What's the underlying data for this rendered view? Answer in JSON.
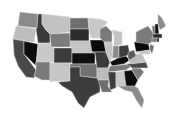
{
  "map": {
    "type": "choropleth",
    "region": "United States",
    "colormap": "grayscale",
    "states": [
      {
        "id": "WA",
        "fill": "#8a8a8a",
        "points": "20,12 38,14 37,28 18,26 19,18"
      },
      {
        "id": "OR",
        "fill": "#bdbdbd",
        "points": "16,26 36,29 34,42 13,39"
      },
      {
        "id": "CA",
        "fill": "#4a4a4a",
        "points": "13,39 24,41 24,54 36,70 34,78 26,77 18,66 14,55"
      },
      {
        "id": "NV",
        "fill": "#0d0d0d",
        "points": "24,41 38,44 36,66 24,54"
      },
      {
        "id": "ID",
        "fill": "#3a3a3a",
        "points": "38,14 42,14 42,24 46,30 50,34 50,43 38,43 36,29 37,28"
      },
      {
        "id": "MT",
        "fill": "#c2c2c2",
        "points": "42,14 70,17 70,32 50,34 46,30 42,24"
      },
      {
        "id": "WY",
        "fill": "#7c7c7c",
        "points": "50,34 70,33 71,47 51,47"
      },
      {
        "id": "UT",
        "fill": "#c9c9c9",
        "points": "38,44 50,43 51,47 54,48 54,62 36,62 36,66 38,44"
      },
      {
        "id": "AZ",
        "fill": "#7a7a7a",
        "points": "36,62 50,62 50,80 42,80 34,76 36,70"
      },
      {
        "id": "CO",
        "fill": "#3c3c3c",
        "points": "54,48 72,48 72,63 54,63"
      },
      {
        "id": "NM",
        "fill": "#c6c6c6",
        "points": "50,63 70,63 70,81 56,81 50,82 50,62"
      },
      {
        "id": "ND",
        "fill": "#6e6e6e",
        "points": "70,18 88,18 89,29 70,29"
      },
      {
        "id": "SD",
        "fill": "#2e2e2e",
        "points": "70,29 89,29 89,41 70,41"
      },
      {
        "id": "NE",
        "fill": "#c4c4c4",
        "points": "70,41 91,41 94,53 72,53 72,48 70,47"
      },
      {
        "id": "KS",
        "fill": "#0f0f0f",
        "points": "72,53 95,53 95,64 72,64"
      },
      {
        "id": "OK",
        "fill": "#707070",
        "points": "70,64 97,64 97,78 80,76 80,67 70,67"
      },
      {
        "id": "TX",
        "fill": "#3d3d3d",
        "points": "70,67 80,67 80,76 97,78 100,80 100,92 90,97 84,108 78,103 72,92 62,86 58,82 70,81"
      },
      {
        "id": "MN",
        "fill": "#c8c8c8",
        "points": "88,18 100,19 108,22 100,30 100,38 91,38 89,29"
      },
      {
        "id": "IA",
        "fill": "#0a0a0a",
        "points": "90,40 104,40 106,52 92,52"
      },
      {
        "id": "MO",
        "fill": "#3a3a3a",
        "points": "92,52 106,52 110,62 108,68 97,68 95,53"
      },
      {
        "id": "AR",
        "fill": "#bbbbbb",
        "points": "97,68 110,68 109,80 98,80 97,76"
      },
      {
        "id": "LA",
        "fill": "#6e6e6e",
        "points": "98,80 109,80 108,86 112,92 102,92 100,86"
      },
      {
        "id": "WI",
        "fill": "#7a7a7a",
        "points": "100,29 106,26 112,32 112,42 104,42 100,38"
      },
      {
        "id": "IL",
        "fill": "#c5c5c5",
        "points": "104,42 112,42 113,54 110,62 106,52"
      },
      {
        "id": "MI",
        "fill": "#c3c3c3",
        "points": "112,30 122,32 122,44 114,46 114,36"
      },
      {
        "id": "IN",
        "fill": "#8a8a8a",
        "points": "113,46 119,46 119,58 112,58 113,54"
      },
      {
        "id": "OH",
        "fill": "#3e3e3e",
        "points": "119,46 128,45 130,54 122,58 119,58"
      },
      {
        "id": "KY",
        "fill": "#0d0d0d",
        "points": "110,62 118,58 126,56 130,60 124,64 112,66"
      },
      {
        "id": "TN",
        "fill": "#7a7a7a",
        "points": "110,66 130,64 132,66 126,70 108,72"
      },
      {
        "id": "MS",
        "fill": "#3e3e3e",
        "points": "108,72 116,72 116,88 110,90 109,80"
      },
      {
        "id": "AL",
        "fill": "#c8c8c8",
        "points": "116,72 124,71 126,86 118,86 116,88"
      },
      {
        "id": "GA",
        "fill": "#0d0d0d",
        "points": "124,71 132,70 138,80 134,88 126,86"
      },
      {
        "id": "FL",
        "fill": "#8a8a8a",
        "points": "118,86 134,86 138,88 144,100 142,108 136,100 132,92 124,90"
      },
      {
        "id": "SC",
        "fill": "#7a7a7a",
        "points": "132,68 140,68 144,72 138,80 132,70"
      },
      {
        "id": "NC",
        "fill": "#4a4a4a",
        "points": "126,64 146,62 148,68 140,68 132,68 130,66"
      },
      {
        "id": "VA",
        "fill": "#bdbdbd",
        "points": "128,58 134,54 142,54 146,62 130,64"
      },
      {
        "id": "WV",
        "fill": "#5a5a5a",
        "points": "128,52 134,50 136,56 130,60 128,58"
      },
      {
        "id": "PA",
        "fill": "#0a0a0a",
        "points": "134,42 148,42 150,50 136,52"
      },
      {
        "id": "NY",
        "fill": "#7a7a7a",
        "points": "136,32 148,26 154,34 152,42 148,44 136,42"
      },
      {
        "id": "NJ",
        "fill": "#6a6a6a",
        "points": "150,44 154,46 152,54 150,50"
      },
      {
        "id": "MD",
        "fill": "#c5c5c5",
        "points": "136,52 150,50 150,54 142,54"
      },
      {
        "id": "ME",
        "fill": "#8a8a8a",
        "points": "158,14 162,18 166,26 160,30 158,24"
      },
      {
        "id": "VT",
        "fill": "#6a6a6a",
        "points": "152,26 155,26 155,34 153,34"
      },
      {
        "id": "NH",
        "fill": "#0d0d0d",
        "points": "155,24 158,24 159,34 155,34"
      },
      {
        "id": "MA",
        "fill": "#2a2a2a",
        "points": "153,34 162,34 162,38 153,38"
      },
      {
        "id": "CT",
        "fill": "#7a7a7a",
        "points": "152,38 157,38 157,42 152,42"
      },
      {
        "id": "RI",
        "fill": "#0d0d0d",
        "points": "157,38 159,38 159,42 157,42"
      }
    ]
  }
}
